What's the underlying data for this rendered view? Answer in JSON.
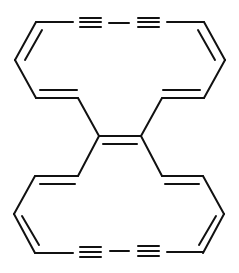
{
  "diagram": {
    "type": "chemical-structure",
    "stroke_color": "#111111",
    "background": "#ffffff"
  }
}
